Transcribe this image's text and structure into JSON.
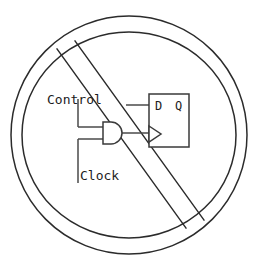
{
  "figure": {
    "name": "prohibited-gated-clock",
    "colors": {
      "background": "#ffffff",
      "circle_stroke": "#2b2b2b",
      "slash_stroke": "#2b2b2b",
      "wire_stroke": "#4a4a4a",
      "symbol_stroke": "#3a3a3a",
      "text": "#1c1c1c"
    }
  },
  "prohibition": {
    "outer_circle": {
      "cx": 129,
      "cy": 135,
      "rx": 118,
      "ry": 119
    },
    "inner_circle": {
      "cx": 129,
      "cy": 135,
      "rx": 107,
      "ry": 103
    },
    "slash_bar": {
      "line_a": {
        "x1": 57,
        "y1": 49,
        "x2": 186,
        "y2": 228
      },
      "line_b": {
        "x1": 75,
        "y1": 41,
        "x2": 204,
        "y2": 220
      }
    }
  },
  "labels": {
    "control": "Control",
    "clock": "Clock",
    "d_pin": "D",
    "q_pin": "Q"
  },
  "icon_names": {
    "prohibition": "prohibition-circle-icon",
    "slash": "prohibition-slash-icon",
    "and_gate": "and-gate-icon",
    "flip_flop": "d-flip-flop-icon",
    "clock_triangle": "clock-edge-triangle-icon"
  },
  "circuit": {
    "and_gate": {
      "x": 103,
      "y": 122,
      "w": 18,
      "h": 22
    },
    "flip_flop": {
      "x": 149,
      "y": 94,
      "w": 40,
      "h": 53
    },
    "clock_triangle": {
      "x": 149,
      "y": 126,
      "w": 12,
      "h": 16
    },
    "wires": [
      {
        "name": "control-stub-vertical",
        "x1": 78,
        "y1": 99,
        "x2": 78,
        "y2": 127
      },
      {
        "name": "control-to-and-top",
        "x1": 78,
        "y1": 127,
        "x2": 103,
        "y2": 127
      },
      {
        "name": "clock-to-and-bottom",
        "x1": 78,
        "y1": 139,
        "x2": 103,
        "y2": 139
      },
      {
        "name": "clock-stub-vertical",
        "x1": 78,
        "y1": 139,
        "x2": 78,
        "y2": 183
      },
      {
        "name": "and-out-to-ff-clock",
        "x1": 121,
        "y1": 133,
        "x2": 149,
        "y2": 133
      },
      {
        "name": "d-input-wire",
        "x1": 125,
        "y1": 105,
        "x2": 149,
        "y2": 105
      }
    ]
  }
}
